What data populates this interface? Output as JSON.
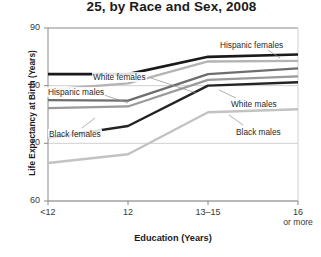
{
  "chart_data": {
    "type": "line",
    "title": "25, by Race and Sex, 2008",
    "xlabel": "Education (Years)",
    "ylabel": "Life Expectancy at Birth (Years)",
    "categories": [
      "<12",
      "12",
      "13–15",
      "16 or more"
    ],
    "xtick_labels": [
      "<12",
      "12",
      "13–15",
      "16"
    ],
    "xtick_sublabel_last": "or more",
    "ylim": [
      60,
      90
    ],
    "yticks": [
      60,
      70,
      80,
      90
    ],
    "grid": "horizontal",
    "legend": "inline-annotations",
    "series": [
      {
        "name": "Hispanic females",
        "values": [
          82.0,
          82.0,
          85.0,
          85.4
        ],
        "color": "#1a1a1a",
        "width": 2.6
      },
      {
        "name": "White females",
        "values": [
          79.3,
          80.4,
          84.2,
          84.3
        ],
        "color": "#b4b4b4",
        "width": 2.4
      },
      {
        "name": "Hispanic males",
        "values": [
          77.5,
          77.4,
          82.0,
          83.0
        ],
        "color": "#6e6e6e",
        "width": 2.4
      },
      {
        "name": "White males",
        "values": [
          70.9,
          73.0,
          80.0,
          80.6
        ],
        "color": "#232323",
        "width": 2.4
      },
      {
        "name": "Black females",
        "values": [
          76.1,
          76.4,
          81.0,
          81.6
        ],
        "color": "#9a9a9a",
        "width": 2.2
      },
      {
        "name": "Black males",
        "values": [
          66.6,
          68.1,
          75.4,
          75.9
        ],
        "color": "#c2c2c2",
        "width": 2.4
      }
    ],
    "annotations": [
      {
        "text": "Hispanic females",
        "x": 219,
        "y": 40,
        "leader": [
          268,
          50,
          280,
          58
        ]
      },
      {
        "text": "White females",
        "x": 92,
        "y": 72,
        "leader": [
          151,
          78,
          196,
          93
        ]
      },
      {
        "text": "Hispanic males",
        "x": 47,
        "y": 87,
        "leader": [
          98,
          93,
          128,
          103
        ]
      },
      {
        "text": "White males",
        "x": 230,
        "y": 99,
        "leader": [
          236,
          98,
          219,
          90
        ]
      },
      {
        "text": "Black females",
        "x": 48,
        "y": 129,
        "leader": [
          82,
          128,
          95,
          118
        ]
      },
      {
        "text": "Black males",
        "x": 235,
        "y": 127,
        "leader": [
          243,
          125,
          229,
          115
        ]
      }
    ]
  },
  "axis_colors": {
    "axis_line": "#8a8a8a",
    "grid_line": "#d0d0d0",
    "text": "#2a2a2a"
  }
}
